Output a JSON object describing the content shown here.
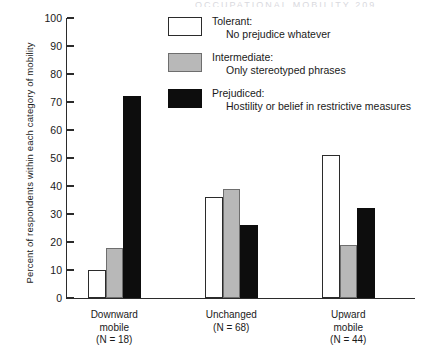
{
  "running_head": "OCCUPATIONAL MOBILITY   209",
  "chart_data": {
    "type": "bar",
    "title": "",
    "xlabel": "",
    "ylabel": "Percent of respondents within each category of mobility",
    "ylim": [
      0,
      100
    ],
    "ytick_values": [
      0,
      10,
      20,
      30,
      40,
      50,
      60,
      70,
      80,
      90,
      100
    ],
    "ytick_labels": [
      "0",
      "10",
      "20",
      "30",
      "40",
      "50",
      "60",
      "70",
      "80",
      "90",
      "100"
    ],
    "grid": false,
    "legend_position": "top-right",
    "categories": [
      "Downward mobile",
      "Unchanged",
      "Upward mobile"
    ],
    "category_counts": [
      "(N = 18)",
      "(N = 68)",
      "(N = 44)"
    ],
    "category_lines": [
      [
        "Downward",
        "mobile"
      ],
      [
        "Unchanged"
      ],
      [
        "Upward",
        "mobile"
      ]
    ],
    "series": [
      {
        "name": "Tolerant",
        "color": "#ffffff",
        "values": [
          10,
          36,
          51
        ]
      },
      {
        "name": "Intermediate",
        "color": "#b8b8b8",
        "values": [
          18,
          39,
          19
        ]
      },
      {
        "name": "Prejudiced",
        "color": "#0d0d0d",
        "values": [
          72,
          26,
          32
        ]
      }
    ]
  },
  "legend": {
    "items": [
      {
        "swatch": "tolerant",
        "title": "Tolerant:",
        "sub": "No prejudice whatever"
      },
      {
        "swatch": "intermediate",
        "title": "Intermediate:",
        "sub": "Only stereotyped phrases"
      },
      {
        "swatch": "prejudiced",
        "title": "Prejudiced:",
        "sub": "Hostility or belief in restrictive measures"
      }
    ]
  }
}
